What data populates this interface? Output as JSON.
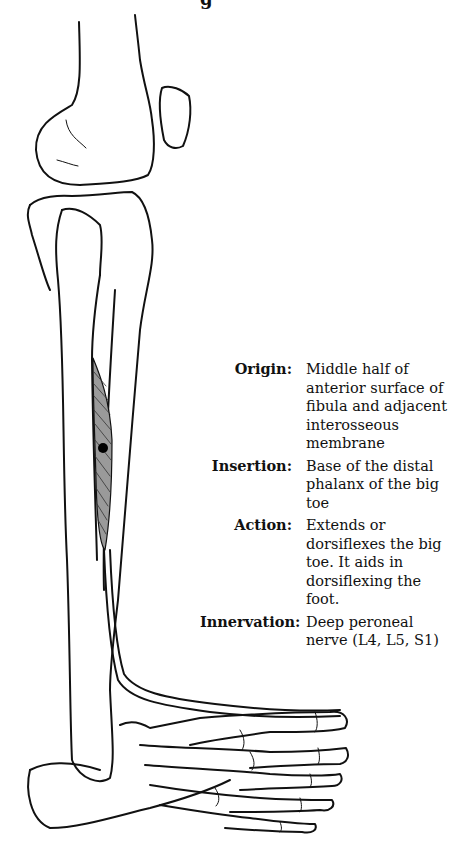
{
  "page": {
    "title_fragment": "g"
  },
  "illustration": {
    "subject": "lower-leg-and-foot-skeleton",
    "highlighted_muscle_color": "#888888",
    "marker_color": "#000000",
    "line_color": "#111111"
  },
  "muscle_info": [
    {
      "label": "Origin:",
      "value": "Middle half of anterior surface of fibula and adjacent interosseous membrane"
    },
    {
      "label": "Insertion:",
      "value": "Base of the distal phalanx of the big toe"
    },
    {
      "label": "Action:",
      "value": "Extends or dorsiflexes the big toe. It aids in dorsiflexing the foot."
    },
    {
      "label": "Innervation:",
      "value": "Deep peroneal nerve (L4, L5, S1)"
    }
  ]
}
